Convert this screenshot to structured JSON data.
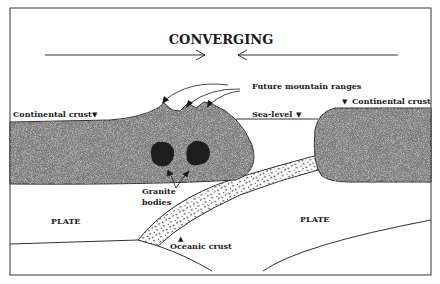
{
  "title": "CONVERGING",
  "labels": {
    "future_mountain_ranges": "Future mountain ranges",
    "continental_crust_left": "Continental crust",
    "continental_crust_right": "Continental crust",
    "sea_level": "Sea-level",
    "granite_line1": "Granite",
    "granite_line2": "bodies",
    "plate_left": "PLATE",
    "plate_right": "PLATE",
    "oceanic_crust": "Oceanic crust"
  },
  "markers": {
    "down_triangle": "▼",
    "up_triangle": "▲"
  },
  "colors": {
    "ink": "#1a1a1a",
    "crust_fill": "#8a8a8a",
    "granite_fill": "#222222",
    "background": "#ffffff"
  }
}
